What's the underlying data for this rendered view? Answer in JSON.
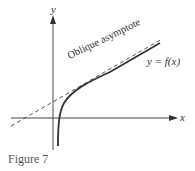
{
  "figure": {
    "caption": "Figure 7",
    "axes": {
      "x_label": "x",
      "y_label": "y"
    },
    "curve_label": "y = f(x)",
    "asymptote_label": "Oblique asymptote",
    "colors": {
      "axis": "#444444",
      "curve": "#333333",
      "asymptote": "#555555",
      "text": "#333333"
    }
  }
}
